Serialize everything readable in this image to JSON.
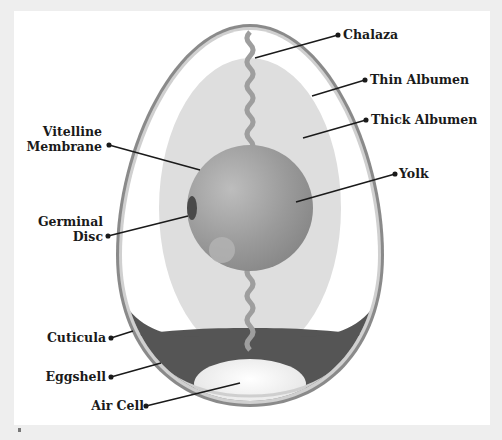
{
  "diagram": {
    "labels": {
      "chalaza": "Chalaza",
      "thin_albumen": "Thin Albumen",
      "thick_albumen": "Thick Albumen",
      "yolk": "Yolk",
      "vitelline_1": "Vitelline",
      "vitelline_2": "Membrane",
      "germinal_1": "Germinal",
      "germinal_2": "Disc",
      "cuticula": "Cuticula",
      "eggshell": "Eggshell",
      "air_cell": "Air Cell"
    },
    "colors": {
      "background": "#eeeeee",
      "panel": "#ffffff",
      "shell_outer": "#8a8a8a",
      "shell_inner": "#c8c8c8",
      "thick_albumen": "#dedede",
      "yolk": "#9c9c9c",
      "air_band": "#555555",
      "air_cell": "#f7f7f7",
      "leader_line": "#1a1a1a"
    }
  }
}
